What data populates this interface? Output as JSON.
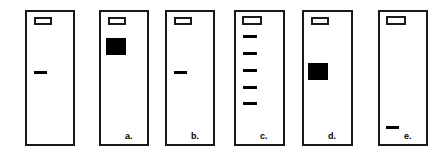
{
  "figure": {
    "type": "gel-electrophoresis-diagram",
    "width": 448,
    "height": 156,
    "background_color": "#ffffff",
    "line_color": "#1a1a1a",
    "band_color": "#000000"
  },
  "lanes": [
    {
      "id": "lane-1",
      "label": "",
      "x": 25,
      "y": 10,
      "w": 50,
      "h": 136,
      "well": {
        "x": 7,
        "y": 5,
        "w": 18,
        "h": 8
      },
      "label_x": 0,
      "label_y": 0,
      "bands": [
        {
          "name": "thin-band",
          "x": 7,
          "y": 59,
          "w": 13,
          "h": 3
        }
      ]
    },
    {
      "id": "lane-2",
      "label": "a.",
      "x": 99,
      "y": 10,
      "w": 50,
      "h": 136,
      "well": {
        "x": 7,
        "y": 5,
        "w": 18,
        "h": 8
      },
      "label_x": 24,
      "label_y": 120,
      "bands": [
        {
          "name": "thick-band",
          "x": 5,
          "y": 26,
          "w": 20,
          "h": 17
        }
      ]
    },
    {
      "id": "lane-3",
      "label": "b.",
      "x": 165,
      "y": 10,
      "w": 50,
      "h": 136,
      "well": {
        "x": 7,
        "y": 5,
        "w": 18,
        "h": 8
      },
      "label_x": 24,
      "label_y": 120,
      "bands": [
        {
          "name": "thin-band",
          "x": 7,
          "y": 59,
          "w": 13,
          "h": 3
        }
      ]
    },
    {
      "id": "lane-4",
      "label": "c.",
      "x": 234,
      "y": 10,
      "w": 51,
      "h": 136,
      "well": {
        "x": 6,
        "y": 4,
        "w": 20,
        "h": 9
      },
      "label_x": 24,
      "label_y": 120,
      "bands": [
        {
          "name": "ladder-band-1",
          "x": 7,
          "y": 23,
          "w": 14,
          "h": 3
        },
        {
          "name": "ladder-band-2",
          "x": 7,
          "y": 40,
          "w": 14,
          "h": 3
        },
        {
          "name": "ladder-band-3",
          "x": 7,
          "y": 57,
          "w": 14,
          "h": 3
        },
        {
          "name": "ladder-band-4",
          "x": 7,
          "y": 74,
          "w": 14,
          "h": 3
        },
        {
          "name": "ladder-band-5",
          "x": 7,
          "y": 90,
          "w": 14,
          "h": 3
        }
      ]
    },
    {
      "id": "lane-5",
      "label": "d.",
      "x": 302,
      "y": 10,
      "w": 51,
      "h": 136,
      "well": {
        "x": 7,
        "y": 5,
        "w": 18,
        "h": 8
      },
      "label_x": 24,
      "label_y": 120,
      "bands": [
        {
          "name": "thick-band",
          "x": 4,
          "y": 51,
          "w": 20,
          "h": 17
        }
      ]
    },
    {
      "id": "lane-6",
      "label": "e.",
      "x": 378,
      "y": 10,
      "w": 50,
      "h": 136,
      "well": {
        "x": 6,
        "y": 4,
        "w": 20,
        "h": 9
      },
      "label_x": 24,
      "label_y": 120,
      "bands": [
        {
          "name": "thin-band",
          "x": 6,
          "y": 114,
          "w": 13,
          "h": 3
        }
      ]
    }
  ]
}
